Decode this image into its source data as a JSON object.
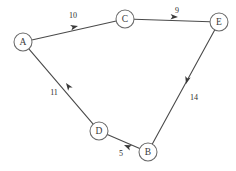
{
  "diagram": {
    "background_color": "#ffffff",
    "node_stroke_color": "#6a6a6a",
    "node_fill_color": "#ffffff",
    "edge_color": "#4a4a4a",
    "arrow_color": "#3a3a3a",
    "label_color": "#2e2e2e",
    "node_radius": 9,
    "nodes": [
      {
        "id": "A",
        "label": "A",
        "x": 23,
        "y": 42
      },
      {
        "id": "C",
        "label": "C",
        "x": 125,
        "y": 19
      },
      {
        "id": "E",
        "label": "E",
        "x": 219,
        "y": 22
      },
      {
        "id": "D",
        "label": "D",
        "x": 99,
        "y": 131
      },
      {
        "id": "B",
        "label": "B",
        "x": 148,
        "y": 152
      }
    ],
    "edges": [
      {
        "id": "A-C",
        "from": "A",
        "to": "C",
        "weight": "10",
        "label_x": 73,
        "label_y": 15,
        "arrow_x": 78,
        "arrow_y": 26,
        "arrow_angle": -13
      },
      {
        "id": "C-E",
        "from": "C",
        "to": "E",
        "weight": "9",
        "label_x": 177,
        "label_y": 10,
        "arrow_x": 178,
        "arrow_y": 17,
        "arrow_angle": 2
      },
      {
        "id": "E-B",
        "from": "E",
        "to": "B",
        "weight": "14",
        "label_x": 194,
        "label_y": 97,
        "arrow_x": 186,
        "arrow_y": 84,
        "arrow_angle": 105
      },
      {
        "id": "B-D",
        "from": "B",
        "to": "D",
        "weight": "5",
        "label_x": 121,
        "label_y": 153,
        "arrow_x": 124,
        "arrow_y": 145,
        "arrow_angle": 203
      },
      {
        "id": "D-A",
        "from": "D",
        "to": "A",
        "weight": "11",
        "label_x": 54,
        "label_y": 92,
        "arrow_x": 66,
        "arrow_y": 83,
        "arrow_angle": 234
      }
    ]
  }
}
